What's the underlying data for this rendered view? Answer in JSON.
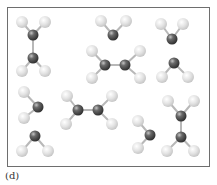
{
  "figure": {
    "label": "(d)",
    "frame": {
      "x": 7,
      "y": 7,
      "width": 203,
      "height": 160,
      "border_color": "#6e6e6e"
    }
  },
  "colors": {
    "heavy_atom": "#4a4a4a",
    "heavy_atom_highlight": "#bcbcbc",
    "light_atom": "#dcdcdc",
    "light_atom_highlight": "#ffffff",
    "bond": "#b8b8b8"
  },
  "atom_radius": {
    "heavy": 5.5,
    "light": 6
  },
  "molecules": [
    {
      "name": "ethylene-vertical-top-left",
      "atoms": [
        {
          "el": "H",
          "x": 22,
          "y": 22
        },
        {
          "el": "H",
          "x": 45,
          "y": 22
        },
        {
          "el": "C",
          "x": 33,
          "y": 35
        },
        {
          "el": "C",
          "x": 33,
          "y": 58
        },
        {
          "el": "H",
          "x": 22,
          "y": 71
        },
        {
          "el": "H",
          "x": 45,
          "y": 71
        }
      ],
      "bonds": [
        [
          0,
          2
        ],
        [
          1,
          2
        ],
        [
          2,
          3
        ],
        [
          3,
          4
        ],
        [
          3,
          5
        ]
      ]
    },
    {
      "name": "water-top-middle",
      "atoms": [
        {
          "el": "H",
          "x": 101,
          "y": 21
        },
        {
          "el": "H",
          "x": 126,
          "y": 21
        },
        {
          "el": "O",
          "x": 113,
          "y": 35
        }
      ],
      "bonds": [
        [
          0,
          2
        ],
        [
          1,
          2
        ]
      ]
    },
    {
      "name": "water-top-right",
      "atoms": [
        {
          "el": "H",
          "x": 161,
          "y": 24
        },
        {
          "el": "H",
          "x": 183,
          "y": 24
        },
        {
          "el": "O",
          "x": 172,
          "y": 39
        }
      ],
      "bonds": [
        [
          0,
          2
        ],
        [
          1,
          2
        ]
      ]
    },
    {
      "name": "water-right-middle",
      "atoms": [
        {
          "el": "O",
          "x": 174,
          "y": 63
        },
        {
          "el": "H",
          "x": 162,
          "y": 77
        },
        {
          "el": "H",
          "x": 188,
          "y": 77
        }
      ],
      "bonds": [
        [
          0,
          1
        ],
        [
          0,
          2
        ]
      ]
    },
    {
      "name": "ethylene-horizontal-middle",
      "atoms": [
        {
          "el": "H",
          "x": 92,
          "y": 51
        },
        {
          "el": "H",
          "x": 140,
          "y": 51
        },
        {
          "el": "C",
          "x": 105,
          "y": 65
        },
        {
          "el": "C",
          "x": 125,
          "y": 65
        },
        {
          "el": "H",
          "x": 92,
          "y": 78
        },
        {
          "el": "H",
          "x": 140,
          "y": 78
        }
      ],
      "bonds": [
        [
          0,
          2
        ],
        [
          4,
          2
        ],
        [
          2,
          3
        ],
        [
          3,
          1
        ],
        [
          3,
          5
        ]
      ]
    },
    {
      "name": "water-left-middle",
      "atoms": [
        {
          "el": "H",
          "x": 24,
          "y": 92
        },
        {
          "el": "O",
          "x": 38,
          "y": 107
        },
        {
          "el": "H",
          "x": 24,
          "y": 118
        }
      ],
      "bonds": [
        [
          0,
          1
        ],
        [
          2,
          1
        ]
      ]
    },
    {
      "name": "water-bottom-left",
      "atoms": [
        {
          "el": "O",
          "x": 35,
          "y": 136
        },
        {
          "el": "H",
          "x": 22,
          "y": 151
        },
        {
          "el": "H",
          "x": 48,
          "y": 151
        }
      ],
      "bonds": [
        [
          0,
          1
        ],
        [
          0,
          2
        ]
      ]
    },
    {
      "name": "ethylene-horizontal-bottom",
      "atoms": [
        {
          "el": "H",
          "x": 67,
          "y": 96
        },
        {
          "el": "H",
          "x": 112,
          "y": 96
        },
        {
          "el": "C",
          "x": 78,
          "y": 110
        },
        {
          "el": "C",
          "x": 98,
          "y": 110
        },
        {
          "el": "H",
          "x": 66,
          "y": 124
        },
        {
          "el": "H",
          "x": 112,
          "y": 124
        }
      ],
      "bonds": [
        [
          0,
          2
        ],
        [
          4,
          2
        ],
        [
          2,
          3
        ],
        [
          3,
          1
        ],
        [
          3,
          5
        ]
      ]
    },
    {
      "name": "water-bottom-right",
      "atoms": [
        {
          "el": "H",
          "x": 138,
          "y": 121
        },
        {
          "el": "O",
          "x": 150,
          "y": 135
        },
        {
          "el": "H",
          "x": 138,
          "y": 148
        }
      ],
      "bonds": [
        [
          0,
          1
        ],
        [
          2,
          1
        ]
      ]
    },
    {
      "name": "ethylene-vertical-bottom-right",
      "atoms": [
        {
          "el": "H",
          "x": 168,
          "y": 101
        },
        {
          "el": "H",
          "x": 194,
          "y": 101
        },
        {
          "el": "C",
          "x": 181,
          "y": 116
        },
        {
          "el": "C",
          "x": 181,
          "y": 137
        },
        {
          "el": "H",
          "x": 167,
          "y": 151
        },
        {
          "el": "H",
          "x": 194,
          "y": 151
        }
      ],
      "bonds": [
        [
          0,
          2
        ],
        [
          1,
          2
        ],
        [
          2,
          3
        ],
        [
          3,
          4
        ],
        [
          3,
          5
        ]
      ]
    }
  ]
}
